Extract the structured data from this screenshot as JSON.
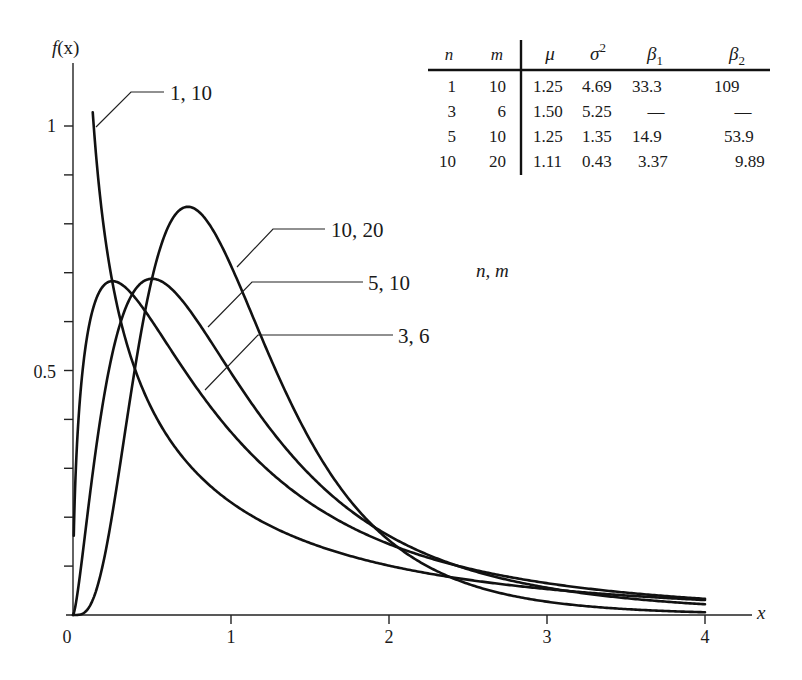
{
  "chart_data": {
    "type": "line",
    "title": "",
    "xlabel": "x",
    "ylabel": "f(x)",
    "xlim": [
      0,
      4
    ],
    "ylim": [
      0,
      1.1
    ],
    "grid": false,
    "x_ticks": [
      {
        "value": 0,
        "label": "0"
      },
      {
        "value": 1,
        "label": "1"
      },
      {
        "value": 2,
        "label": "2"
      },
      {
        "value": 3,
        "label": "3"
      },
      {
        "value": 4,
        "label": "4"
      }
    ],
    "y_ticks": [
      0.1,
      0.2,
      0.3,
      0.4,
      0.5,
      0.6,
      0.7,
      0.8,
      0.9,
      1.0
    ],
    "y_tick_labels": [
      {
        "value": 0.5,
        "label": "0.5"
      },
      {
        "value": 1.0,
        "label": "1"
      }
    ],
    "distribution": "F density with n, m degrees of freedom",
    "series": [
      {
        "name": "1, 10",
        "n": 1,
        "m": 10,
        "x_start": 0.125,
        "peak": {
          "x": 0.125,
          "y": 1.08
        },
        "points": [
          [
            0.125,
            1.08
          ],
          [
            0.25,
            0.71
          ],
          [
            0.5,
            0.43
          ],
          [
            1,
            0.22
          ],
          [
            2,
            0.09
          ],
          [
            3,
            0.05
          ],
          [
            4,
            0.03
          ]
        ]
      },
      {
        "name": "3, 6",
        "n": 3,
        "m": 6,
        "x_start": 0.005,
        "peak": {
          "x": 0.25,
          "y": 0.68
        },
        "points": [
          [
            0.01,
            0.26
          ],
          [
            0.25,
            0.68
          ],
          [
            0.5,
            0.63
          ],
          [
            1,
            0.4
          ],
          [
            2,
            0.16
          ],
          [
            3,
            0.07
          ],
          [
            4,
            0.04
          ]
        ]
      },
      {
        "name": "5, 10",
        "n": 5,
        "m": 10,
        "x_start": 0,
        "peak": {
          "x": 0.5,
          "y": 0.69
        },
        "points": [
          [
            0,
            0
          ],
          [
            0.25,
            0.53
          ],
          [
            0.5,
            0.69
          ],
          [
            1,
            0.5
          ],
          [
            2,
            0.16
          ],
          [
            3,
            0.05
          ],
          [
            4,
            0.02
          ]
        ]
      },
      {
        "name": "10, 20",
        "n": 10,
        "m": 20,
        "x_start": 0,
        "peak": {
          "x": 0.73,
          "y": 0.84
        },
        "points": [
          [
            0,
            0
          ],
          [
            0.25,
            0.24
          ],
          [
            0.5,
            0.71
          ],
          [
            0.75,
            0.84
          ],
          [
            1,
            0.69
          ],
          [
            2,
            0.09
          ],
          [
            3,
            0.01
          ],
          [
            4,
            0.002
          ]
        ]
      }
    ],
    "legend_title": "n, m",
    "annotations": [
      "1, 10",
      "10, 20",
      "5, 10",
      "3, 6",
      "n, m"
    ],
    "table": {
      "headers": [
        "n",
        "m",
        "μ",
        "σ²",
        "β₁",
        "β₂"
      ],
      "rows": [
        [
          "1",
          "10",
          "1.25",
          "4.69",
          "33.3",
          "109"
        ],
        [
          "3",
          "6",
          "1.50",
          "5.25",
          "—",
          "—"
        ],
        [
          "5",
          "10",
          "1.25",
          "1.35",
          "14.9",
          "53.9"
        ],
        [
          "10",
          "20",
          "1.11",
          "0.43",
          "3.37",
          "9.89"
        ]
      ]
    }
  },
  "axes": {
    "y_label_f": "f",
    "y_label_paren": "(x)",
    "x_label": "x",
    "origin_label": "0",
    "y_tick_1": "1",
    "y_tick_half": "0.5",
    "x_tick_1": "1",
    "x_tick_2": "2",
    "x_tick_3": "3",
    "x_tick_4": "4"
  },
  "labels": {
    "curve_1_10": "1, 10",
    "curve_10_20": "10, 20",
    "curve_5_10": "5, 10",
    "curve_3_6": "3, 6",
    "legend_nm": "n, m"
  },
  "table": {
    "h_n": "n",
    "h_m": "m",
    "h_mu": "μ",
    "h_sigma": "σ",
    "h_sigma_sup": "2",
    "h_beta1": "β",
    "h_beta1_sub": "1",
    "h_beta2": "β",
    "h_beta2_sub": "2",
    "rows": [
      {
        "n": "1",
        "m": "10",
        "mu": "1.25",
        "var": "4.69",
        "b1": "33.3",
        "b2": "109"
      },
      {
        "n": "3",
        "m": "6",
        "mu": "1.50",
        "var": "5.25",
        "b1": "—",
        "b2": "—"
      },
      {
        "n": "5",
        "m": "10",
        "mu": "1.25",
        "var": "1.35",
        "b1": "14.9",
        "b2": "53.9"
      },
      {
        "n": "10",
        "m": "20",
        "mu": "1.11",
        "var": "0.43",
        "b1": "3.37",
        "b2": "9.89"
      }
    ]
  }
}
